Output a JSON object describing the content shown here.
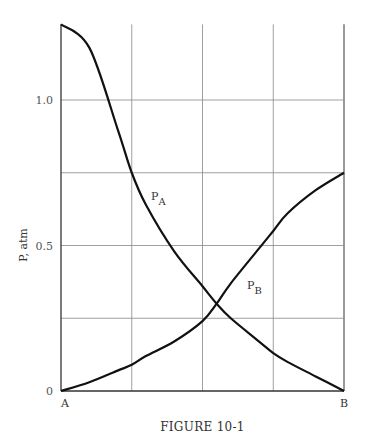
{
  "figure": {
    "caption": "FIGURE 10-1"
  },
  "chart_data": {
    "type": "line",
    "title": "",
    "caption": "FIGURE 10-1",
    "xlabel": "",
    "ylabel": "P, atm",
    "x_tick_labels": [
      "A",
      "B"
    ],
    "y_ticks": [
      0,
      0.25,
      0.5,
      0.75,
      1.0
    ],
    "y_tick_labels": [
      "0",
      "",
      "0.5",
      "",
      "1.0"
    ],
    "x_grid": [
      0,
      0.25,
      0.5,
      0.75,
      1.0
    ],
    "grid": true,
    "xlim": [
      0,
      1
    ],
    "ylim": [
      0,
      1.26
    ],
    "x": [
      0,
      0.1,
      0.2,
      0.25,
      0.3,
      0.4,
      0.5,
      0.55,
      0.6,
      0.7,
      0.75,
      0.8,
      0.9,
      1.0
    ],
    "series": [
      {
        "name": "P_A",
        "label_main": "P",
        "label_sub": "A",
        "values": [
          1.26,
          1.18,
          0.9,
          0.75,
          0.64,
          0.48,
          0.36,
          0.3,
          0.25,
          0.17,
          0.13,
          0.1,
          0.05,
          0.0
        ]
      },
      {
        "name": "P_B",
        "label_main": "P",
        "label_sub": "B",
        "values": [
          0.0,
          0.03,
          0.07,
          0.09,
          0.12,
          0.17,
          0.24,
          0.3,
          0.37,
          0.49,
          0.55,
          0.61,
          0.69,
          0.75
        ]
      }
    ]
  }
}
